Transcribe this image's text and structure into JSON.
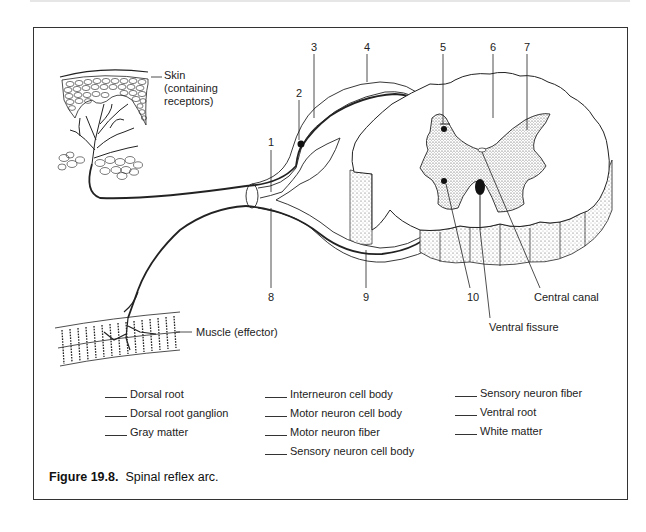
{
  "figure": {
    "caption_number": "Figure 19.8.",
    "caption_text": "Spinal reflex arc."
  },
  "diagram": {
    "callouts": {
      "skin": [
        "Skin",
        "(containing",
        "receptors)"
      ],
      "muscle": "Muscle (effector)",
      "central_canal": "Central canal",
      "ventral_fissure": "Ventral fissure"
    },
    "numbers": [
      "1",
      "2",
      "3",
      "4",
      "5",
      "6",
      "7",
      "8",
      "9",
      "10"
    ]
  },
  "legend": {
    "columns": [
      [
        "Dorsal root",
        "Dorsal root ganglion",
        "Gray matter"
      ],
      [
        "Interneuron cell body",
        "Motor neuron cell body",
        "Motor neuron fiber",
        "Sensory neuron cell body"
      ],
      [
        "Sensory neuron fiber",
        "Ventral root",
        "White matter"
      ]
    ]
  }
}
